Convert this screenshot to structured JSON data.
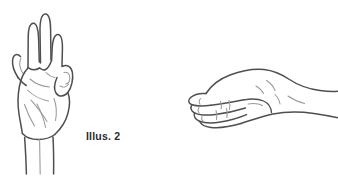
{
  "page": {
    "background_color": "#ffffff",
    "width": 338,
    "height": 177,
    "kind": "line-art-illustration-pair"
  },
  "palette": {
    "background": "#ffffff",
    "outline": "#4f4f4f",
    "outline_dark": "#3b3b3b",
    "detail_line": "#9a9a9a",
    "caption_text": "#2b2b2b"
  },
  "figures": [
    {
      "id": "illus2",
      "caption": "Illus. 2",
      "subject": "hand-three-fingers-up",
      "description": "Right hand held upright, palm forward, index middle and ring fingers extended, pinky folded down and held by the thumb",
      "orientation": "vertical",
      "outline_color": "#4f4f4f",
      "detail_color": "#9a9a9a"
    },
    {
      "id": "illus3",
      "caption": "Illus. 3",
      "subject": "hand-flat-horizontal",
      "description": "Flat hand seen from the side, fingers extended horizontally pointing left, wrist entering from the right",
      "orientation": "horizontal",
      "outline_color": "#4f4f4f",
      "detail_color": "#9a9a9a"
    }
  ]
}
